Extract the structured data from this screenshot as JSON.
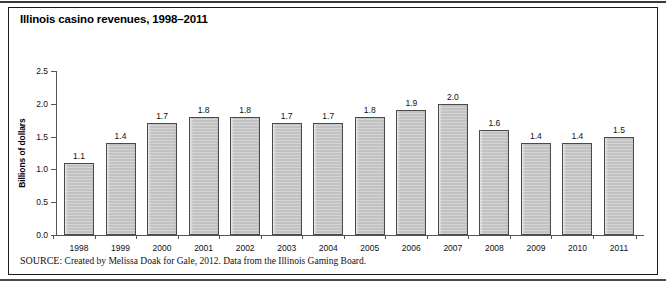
{
  "figure": {
    "title": "Illinois casino revenues, 1998–2011",
    "source_label": "SOURCE:",
    "source_text": "Created by Melissa Doak for Gale, 2012. Data from the Illinois Gaming Board."
  },
  "colors": {
    "bar_fill": "#c9c9c9",
    "bar_border": "#4a4a4a",
    "axis": "#555555",
    "frame": "#1a1a1a",
    "text": "#111111"
  },
  "chart_data": {
    "type": "bar",
    "title": "Illinois casino revenues, 1998–2011",
    "xlabel": "",
    "ylabel": "Billions of dollars",
    "ylim": [
      0.0,
      2.5
    ],
    "ytick_labels": [
      "0.0",
      "0.5",
      "1.0",
      "1.5",
      "2.0",
      "2.5"
    ],
    "yticks": [
      0.0,
      0.5,
      1.0,
      1.5,
      2.0,
      2.5
    ],
    "grid": false,
    "legend": false,
    "categories": [
      "1998",
      "1999",
      "2000",
      "2001",
      "2002",
      "2003",
      "2004",
      "2005",
      "2006",
      "2007",
      "2008",
      "2009",
      "2010",
      "2011"
    ],
    "values": [
      1.1,
      1.4,
      1.7,
      1.8,
      1.8,
      1.7,
      1.7,
      1.8,
      1.9,
      2.0,
      1.6,
      1.4,
      1.4,
      1.5
    ],
    "value_labels": [
      "1.1",
      "1.4",
      "1.7",
      "1.8",
      "1.8",
      "1.7",
      "1.7",
      "1.8",
      "1.9",
      "2.0",
      "1.6",
      "1.4",
      "1.4",
      "1.5"
    ]
  }
}
